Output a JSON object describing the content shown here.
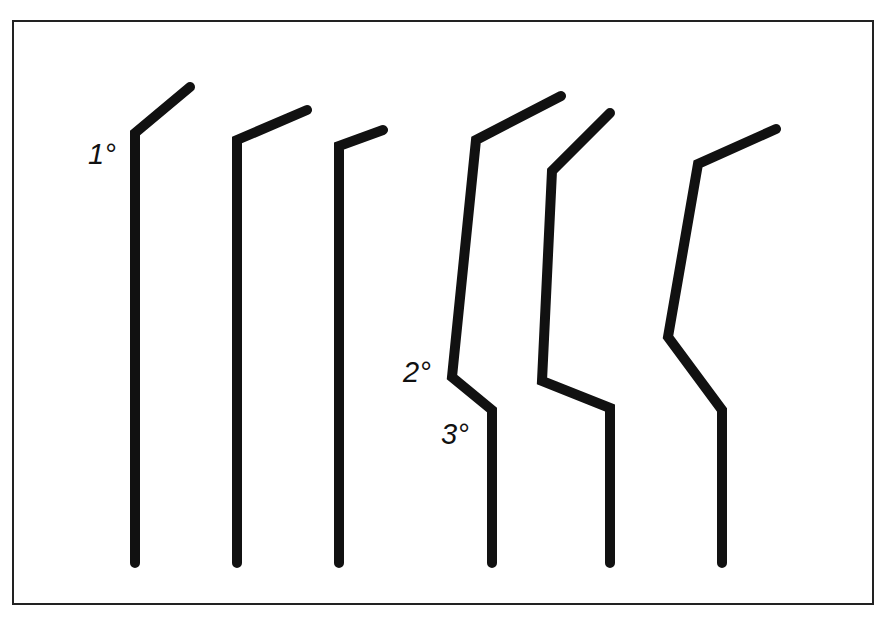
{
  "labels": {
    "primary": "1°",
    "secondary": "2°",
    "tertiary": "3°"
  },
  "colors": {
    "stroke": "#111111",
    "frame": "#222222",
    "background": "#ffffff"
  },
  "figures": [
    {
      "name": "figure-1",
      "points": "190,87 135,133 135,563"
    },
    {
      "name": "figure-2",
      "points": "307,110 237,140 237,563"
    },
    {
      "name": "figure-3",
      "points": "383,130 339,146 339,563"
    },
    {
      "name": "figure-4",
      "points": "561,96 476,140 452,377 492,410 492,563"
    },
    {
      "name": "figure-5",
      "points": "610,113 552,171 542,381 610,408 610,563"
    },
    {
      "name": "figure-6",
      "points": "776,129 698,164 668,337 722,410 722,563"
    }
  ]
}
